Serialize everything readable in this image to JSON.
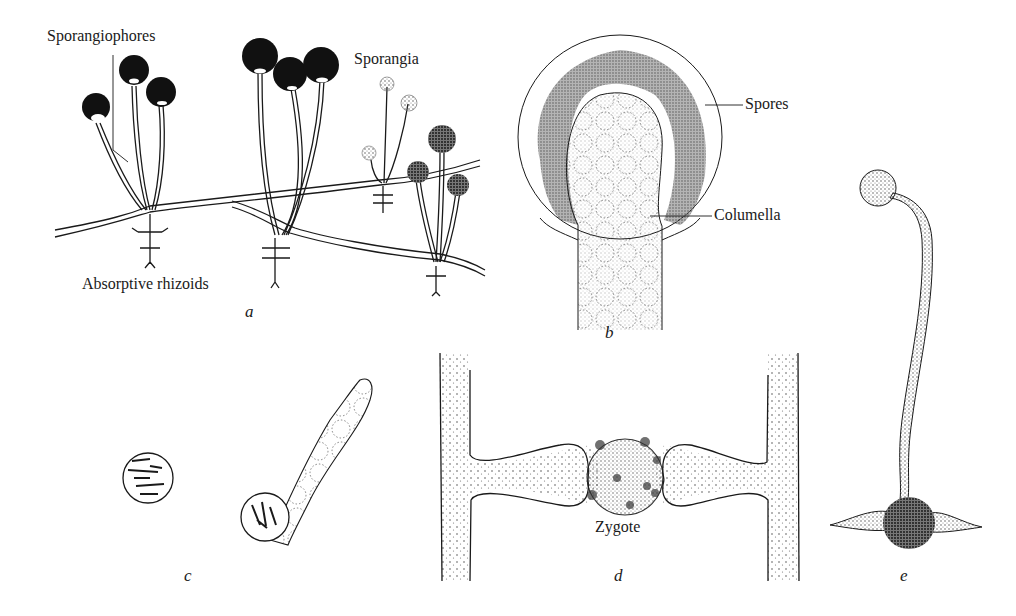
{
  "figure": {
    "panels": [
      {
        "id": "a",
        "letter": "a",
        "labels": {
          "sporangiophores": "Sporangiophores",
          "sporangia": "Sporangia",
          "rhizoids": "Absorptive rhizoids"
        }
      },
      {
        "id": "b",
        "letter": "b",
        "labels": {
          "spores": "Spores",
          "columella": "Columella"
        }
      },
      {
        "id": "c",
        "letter": "c",
        "labels": {}
      },
      {
        "id": "d",
        "letter": "d",
        "labels": {
          "zygote": "Zygote"
        }
      },
      {
        "id": "e",
        "letter": "e",
        "labels": {}
      }
    ]
  },
  "colors": {
    "ink": "#1a1a1a",
    "paper": "#ffffff",
    "stipple": "#555555"
  }
}
